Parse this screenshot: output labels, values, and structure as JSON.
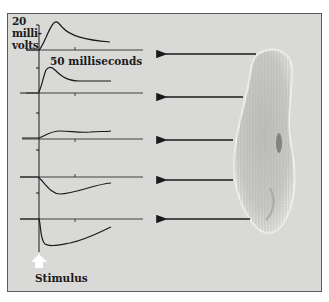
{
  "figure": {
    "y_scale_label": [
      "20",
      "milli-",
      "volts"
    ],
    "x_scale_label": "50 milliseconds",
    "stimulus_label": "Stimulus",
    "stimulus_icon": "up-arrow-icon",
    "colors": {
      "background": "#d9d9d7",
      "border": "#5a5a5a",
      "trace": "#1a1a1a",
      "stimulus_arrow": "#ffffff"
    }
  },
  "traces": [
    {
      "id": 1,
      "response": "large depolarization",
      "baseline_y": 50,
      "arrow_y": 54
    },
    {
      "id": 2,
      "response": "depolarization",
      "baseline_y": 93,
      "arrow_y": 97
    },
    {
      "id": 3,
      "response": "small depolarization",
      "baseline_y": 139,
      "arrow_y": 140
    },
    {
      "id": 4,
      "response": "hyperpolarization",
      "baseline_y": 177,
      "arrow_y": 180
    },
    {
      "id": 5,
      "response": "large hyperpolarization",
      "baseline_y": 219,
      "arrow_y": 219
    }
  ]
}
